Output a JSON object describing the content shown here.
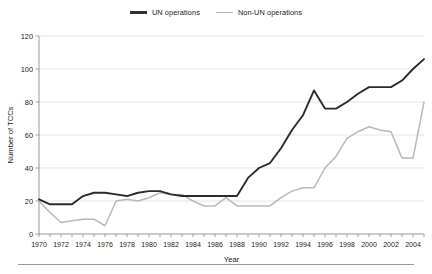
{
  "chart_data": {
    "type": "line",
    "title": "",
    "xlabel": "Year",
    "ylabel": "Number of TCCs",
    "xlim": [
      1970,
      2005
    ],
    "ylim": [
      0,
      120
    ],
    "grid": true,
    "legend_position": "top-center",
    "y_ticks": [
      0,
      20,
      40,
      60,
      80,
      100,
      120
    ],
    "x_ticks": [
      1970,
      1972,
      1974,
      1976,
      1978,
      1980,
      1982,
      1984,
      1986,
      1988,
      1990,
      1992,
      1994,
      1996,
      1998,
      2000,
      2002,
      2004
    ],
    "x_minor_tick_step": 1,
    "x": [
      1970,
      1971,
      1972,
      1973,
      1974,
      1975,
      1976,
      1977,
      1978,
      1979,
      1980,
      1981,
      1982,
      1983,
      1984,
      1985,
      1986,
      1987,
      1988,
      1989,
      1990,
      1991,
      1992,
      1993,
      1994,
      1995,
      1996,
      1997,
      1998,
      1999,
      2000,
      2001,
      2002,
      2003,
      2004,
      2005
    ],
    "series": [
      {
        "name": "UN operations",
        "color": "#2b2b2b",
        "values": [
          21,
          18,
          18,
          18,
          23,
          25,
          25,
          24,
          23,
          25,
          26,
          26,
          24,
          23,
          23,
          23,
          23,
          23,
          23,
          34,
          40,
          43,
          52,
          63,
          72,
          87,
          76,
          76,
          80,
          85,
          89,
          89,
          89,
          93,
          100,
          106
        ]
      },
      {
        "name": "Non-UN operations",
        "color": "#b9b9b9",
        "values": [
          20,
          13,
          7,
          8,
          9,
          9,
          5,
          20,
          21,
          20,
          22,
          25,
          24,
          24,
          20,
          17,
          17,
          22,
          17,
          17,
          17,
          17,
          22,
          26,
          28,
          28,
          40,
          47,
          58,
          62,
          65,
          63,
          62,
          46,
          46,
          80
        ]
      }
    ]
  },
  "legend": {
    "entries": [
      {
        "label": "UN operations",
        "swatch": "line-dark"
      },
      {
        "label": "Non-UN operations",
        "swatch": "line-light"
      }
    ]
  },
  "axes": {
    "y_title": "Number of TCCs",
    "x_title": "Year"
  }
}
